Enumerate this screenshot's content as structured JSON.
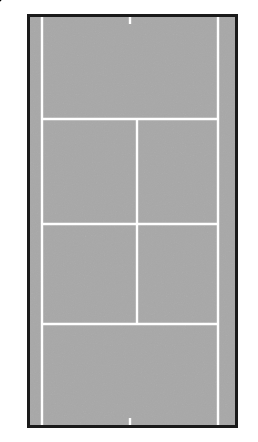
{
  "diagram": {
    "type": "tennis-court-schematic",
    "colors": {
      "court_surface": "#a8a8a8",
      "court_border": "#1a1a1a",
      "court_lines": "#ffffff",
      "annotation": "#000000",
      "background": "#ffffff",
      "marker_fill": "#ffffff"
    },
    "court": {
      "outer": {
        "x": 27,
        "y": 14,
        "width": 211,
        "height": 414
      },
      "border_width": 3,
      "lines": {
        "left_sideline_x": 42,
        "right_sideline_x": 218,
        "center_service_line_x": 137,
        "service_line_top_y": 119,
        "net_line_y": 224,
        "service_line_bottom_y": 324,
        "center_mark_top": {
          "x": 130,
          "y": 14,
          "length": 7
        },
        "center_mark_bottom": {
          "x": 130,
          "y": 428,
          "length": 7
        }
      }
    },
    "labels": [
      {
        "id": "R1",
        "text": "R1",
        "x": 2,
        "y": 3,
        "size": 13,
        "name": "label-r1"
      },
      {
        "id": "RP",
        "text": "RP",
        "x": 141,
        "y": 108,
        "size": 13,
        "name": "label-rp"
      },
      {
        "id": "T1",
        "text": "T1",
        "x": 111,
        "y": 229,
        "size": 13,
        "name": "label-t1"
      },
      {
        "id": "P1",
        "text": "P1",
        "x": 62,
        "y": 240,
        "size": 13,
        "name": "label-p1"
      },
      {
        "id": "SP",
        "text": "SP",
        "x": 86,
        "y": 270,
        "size": 13,
        "name": "label-sp"
      },
      {
        "id": "S",
        "text": "S",
        "x": 192,
        "y": 327,
        "size": 13,
        "name": "label-s"
      },
      {
        "id": "TM",
        "text": "TM",
        "x": 170,
        "y": 393,
        "size": 13,
        "name": "label-tm"
      }
    ],
    "trajectories": [
      {
        "id": "R1-to-TM",
        "name": "dotted-path-r1-to-tm",
        "style": "dotted",
        "points": [
          [
            16,
            14
          ],
          [
            28,
            34
          ],
          [
            70,
            113
          ],
          [
            112,
            200
          ],
          [
            138,
            257
          ],
          [
            160,
            307
          ],
          [
            179,
            381
          ]
        ]
      },
      {
        "id": "R1-left",
        "name": "dotted-path-r1-left",
        "style": "dotted",
        "points": [
          [
            15,
            13
          ],
          [
            21,
            60
          ],
          [
            29,
            130
          ],
          [
            34,
            195
          ],
          [
            38,
            245
          ],
          [
            43,
            310
          ],
          [
            48,
            375
          ],
          [
            52,
            415
          ]
        ]
      }
    ],
    "player_path": {
      "id": "P1-to-T1",
      "name": "solid-path-p1-to-t1",
      "style": "solid",
      "points": [
        [
          34,
          253
        ],
        [
          84,
          262
        ],
        [
          117,
          240
        ]
      ],
      "stroke_width": 2.2
    },
    "shot_arrow": {
      "id": "SP",
      "name": "sp-arrow",
      "from": [
        98,
        283
      ],
      "to": [
        83,
        261
      ],
      "stroke_width": 2.2
    },
    "marker": {
      "id": "TM",
      "name": "tm-marker",
      "shape": "square-with-dot",
      "x": 176,
      "y": 381,
      "size": 11
    }
  }
}
